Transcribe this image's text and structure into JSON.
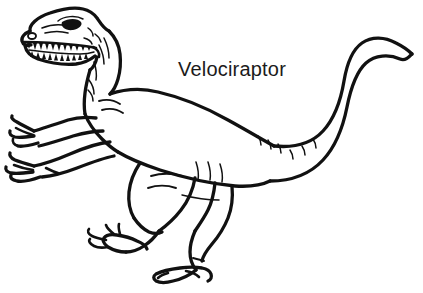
{
  "image": {
    "type": "line-art-illustration",
    "style": "coloring-book black outline on white",
    "width": 423,
    "height": 293,
    "background_color": "#FFFFFF",
    "ink_color": "#111111"
  },
  "label": {
    "text": "Velociraptor",
    "font_size_px": 20,
    "color": "#1B1B1B",
    "x": 178,
    "y": 76,
    "align": "left"
  },
  "subject": {
    "name": "Velociraptor",
    "common_name": "Velociraptor",
    "pose": "standing, facing left, tail raised and curling up to the right",
    "parts": [
      {
        "name": "head",
        "detail": "open jaws with teeth, eye, nostril"
      },
      {
        "name": "upper-jaw-teeth",
        "count_visible": 11
      },
      {
        "name": "lower-jaw-teeth",
        "count_visible": 10
      },
      {
        "name": "eye",
        "detail": "solid filled almond shape"
      },
      {
        "name": "nostril",
        "detail": "small oval near snout tip"
      },
      {
        "name": "neck",
        "detail": "curved with short crease lines"
      },
      {
        "name": "torso",
        "detail": "barrel body with shoulder crease lines"
      },
      {
        "name": "left-arm",
        "detail": "three clawed fingers extended"
      },
      {
        "name": "right-arm",
        "detail": "three clawed fingers extended"
      },
      {
        "name": "near-leg",
        "detail": "thigh, shin, clawed foot with three toes"
      },
      {
        "name": "far-leg",
        "detail": "thigh, shin, clawed foot with three toes"
      },
      {
        "name": "tail",
        "detail": "long, thick at base, curls upward and tapers to a point at upper right"
      }
    ]
  },
  "colors": {
    "ink": "#111111",
    "paper": "#FFFFFF",
    "label_text": "#1B1B1B"
  }
}
